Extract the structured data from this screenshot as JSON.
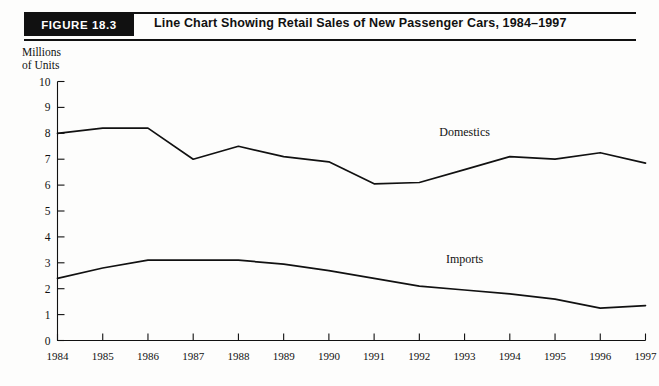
{
  "figure": {
    "badge": "FIGURE 18.3",
    "title": "Line Chart Showing Retail Sales of New Passenger Cars, 1984–1997"
  },
  "axis_caption": {
    "line1": "Millions",
    "line2": "of Units"
  },
  "colors": {
    "ink": "#111111",
    "badge_bg": "#111111",
    "badge_text": "#ffffff",
    "page_bg": "#fdfdfc"
  },
  "chart_data": {
    "type": "line",
    "title": "Line Chart Showing Retail Sales of New Passenger Cars, 1984–1997",
    "xlabel": "",
    "ylabel": "Millions of Units",
    "ylim": [
      0,
      10
    ],
    "xlim": [
      "1984",
      "1997"
    ],
    "grid": false,
    "legend_position": "inline-annotation",
    "categories": [
      "1984",
      "1985",
      "1986",
      "1987",
      "1988",
      "1989",
      "1990",
      "1991",
      "1992",
      "1993",
      "1994",
      "1995",
      "1996",
      "1997"
    ],
    "ytick_labels": [
      "10",
      "9",
      "8",
      "7",
      "6",
      "5",
      "4",
      "3",
      "2",
      "1",
      "0"
    ],
    "yticks": [
      10,
      9,
      8,
      7,
      6,
      5,
      4,
      3,
      2,
      1,
      0
    ],
    "series": [
      {
        "name": "Domestics",
        "values": [
          8.0,
          8.2,
          8.2,
          7.0,
          7.5,
          7.1,
          6.9,
          6.05,
          6.1,
          6.6,
          7.1,
          7.0,
          7.25,
          6.85
        ],
        "label_x": "1993",
        "label_y": 7.9
      },
      {
        "name": "Imports",
        "values": [
          2.4,
          2.8,
          3.1,
          3.1,
          3.1,
          2.95,
          2.7,
          2.4,
          2.1,
          1.95,
          1.8,
          1.6,
          1.25,
          1.35
        ],
        "label_x": "1993",
        "label_y": 3.0
      }
    ]
  }
}
